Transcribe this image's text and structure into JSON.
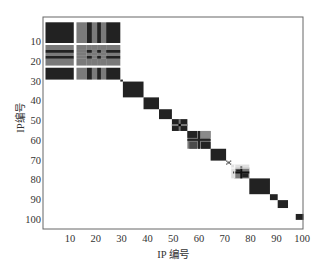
{
  "chart_data": {
    "type": "heatmap",
    "title": "",
    "xlabel": "IP 编号",
    "ylabel": "IP编号",
    "xlim": [
      0.5,
      100.5
    ],
    "ylim": [
      0.5,
      105
    ],
    "x_ticks": [
      10,
      20,
      30,
      40,
      50,
      60,
      70,
      80,
      90,
      100
    ],
    "y_ticks": [
      10,
      20,
      30,
      40,
      50,
      60,
      70,
      80,
      90,
      100
    ],
    "x_tick_labels": [
      "10",
      "20",
      "30",
      "40",
      "50",
      "60",
      "70",
      "80",
      "90",
      "100"
    ],
    "y_tick_labels": [
      "10",
      "20",
      "30",
      "40",
      "50",
      "60",
      "70",
      "80",
      "90",
      "100"
    ],
    "grid": false,
    "legend": null,
    "colors": {
      "dark": "#222222",
      "gray": "#7a7a7a",
      "light": "#b5b5b5",
      "background": "#ffffff",
      "axis": "#555555"
    },
    "diagonal_blocks": [
      {
        "start": 0.5,
        "end": 29.5,
        "pattern": "banded"
      },
      {
        "start": 29.5,
        "end": 30.5,
        "pattern": "solid"
      },
      {
        "start": 30.5,
        "end": 38.5,
        "pattern": "solid"
      },
      {
        "start": 38.5,
        "end": 44.5,
        "pattern": "solid"
      },
      {
        "start": 44.5,
        "end": 49.5,
        "pattern": "solid"
      },
      {
        "start": 49.5,
        "end": 55.5,
        "pattern": "cross"
      },
      {
        "start": 55.5,
        "end": 64.5,
        "pattern": "cross_gray"
      },
      {
        "start": 64.5,
        "end": 70.5,
        "pattern": "solid"
      },
      {
        "start": 70.5,
        "end": 72.5,
        "pattern": "checker"
      },
      {
        "start": 72.5,
        "end": 79.5,
        "pattern": "cross_light"
      },
      {
        "start": 79.5,
        "end": 87.5,
        "pattern": "solid"
      },
      {
        "start": 87.5,
        "end": 90.5,
        "pattern": "solid"
      },
      {
        "start": 90.5,
        "end": 94.5,
        "pattern": "solid"
      },
      {
        "start": 97.5,
        "end": 100.5,
        "pattern": "solid"
      }
    ],
    "banded_block": {
      "segments": [
        {
          "start": 0.5,
          "end": 11.5,
          "tone": "dark"
        },
        {
          "start": 11.5,
          "end": 12.5,
          "tone": "white"
        },
        {
          "start": 12.5,
          "end": 16.5,
          "tone": "gray"
        },
        {
          "start": 16.5,
          "end": 18.5,
          "tone": "dark"
        },
        {
          "start": 18.5,
          "end": 20.5,
          "tone": "gray"
        },
        {
          "start": 20.5,
          "end": 22.0,
          "tone": "dark"
        },
        {
          "start": 22.0,
          "end": 24.0,
          "tone": "gray"
        },
        {
          "start": 24.0,
          "end": 29.5,
          "tone": "dark"
        }
      ],
      "row_segments": [
        {
          "start": 0.5,
          "end": 11.0,
          "tone": "dark"
        },
        {
          "start": 11.0,
          "end": 12.0,
          "tone": "white"
        },
        {
          "start": 12.0,
          "end": 14.5,
          "tone": "gray"
        },
        {
          "start": 14.5,
          "end": 16.0,
          "tone": "dark"
        },
        {
          "start": 16.0,
          "end": 17.5,
          "tone": "gray"
        },
        {
          "start": 17.5,
          "end": 19.0,
          "tone": "dark"
        },
        {
          "start": 19.0,
          "end": 22.5,
          "tone": "gray"
        },
        {
          "start": 22.5,
          "end": 23.5,
          "tone": "white"
        },
        {
          "start": 23.5,
          "end": 29.5,
          "tone": "dark"
        }
      ]
    }
  }
}
